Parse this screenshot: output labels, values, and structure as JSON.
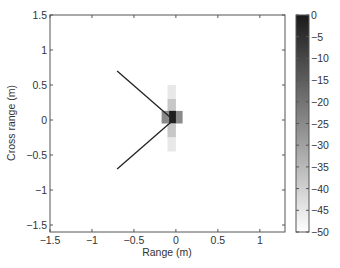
{
  "chart_data": {
    "type": "heatmap",
    "title": "",
    "xlabel": "Range (m)",
    "ylabel": "Cross range (m)",
    "xlim": [
      -1.5,
      1.3
    ],
    "ylim": [
      -1.6,
      1.5
    ],
    "xticks": [
      -1.5,
      -1,
      -0.5,
      0,
      0.5,
      1
    ],
    "xtick_labels": [
      "−1.5",
      "−1",
      "−0.5",
      "0",
      "0.5",
      "1"
    ],
    "yticks": [
      1.5,
      1,
      0.5,
      0,
      -0.5,
      -1,
      -1.5
    ],
    "ytick_labels": [
      "1.5",
      "1",
      "0.5",
      "0",
      "−0.5",
      "−1",
      "−1.5"
    ],
    "grid": false,
    "colormap": "gray (reversed: 0 = black, -50 = white)",
    "colorbar": {
      "range": [
        -50,
        0
      ],
      "ticks": [
        0,
        -5,
        -10,
        -15,
        -20,
        -25,
        -30,
        -35,
        -40,
        -45,
        -50
      ],
      "tick_labels": [
        "0",
        "−5",
        "−10",
        "−15",
        "−20",
        "−25",
        "−30",
        "−35",
        "−40",
        "−45",
        "−50"
      ]
    },
    "cells": [
      {
        "x": [
          -0.1,
          0.0
        ],
        "y": [
          0.3,
          0.5
        ],
        "value": -45
      },
      {
        "x": [
          -0.1,
          0.0
        ],
        "y": [
          0.1,
          0.3
        ],
        "value": -38
      },
      {
        "x": [
          -0.17,
          0.08
        ],
        "y": [
          -0.05,
          0.13
        ],
        "value": -25
      },
      {
        "x": [
          -0.08,
          0.0
        ],
        "y": [
          -0.05,
          0.13
        ],
        "value": -2
      },
      {
        "x": [
          -0.1,
          0.0
        ],
        "y": [
          -0.25,
          -0.05
        ],
        "value": -38
      },
      {
        "x": [
          -0.1,
          0.0
        ],
        "y": [
          -0.45,
          -0.25
        ],
        "value": -45
      }
    ],
    "lines": [
      {
        "from": [
          -0.7,
          0.7
        ],
        "to": [
          -0.03,
          0.0
        ]
      },
      {
        "from": [
          -0.7,
          -0.7
        ],
        "to": [
          -0.03,
          0.0
        ]
      }
    ]
  }
}
